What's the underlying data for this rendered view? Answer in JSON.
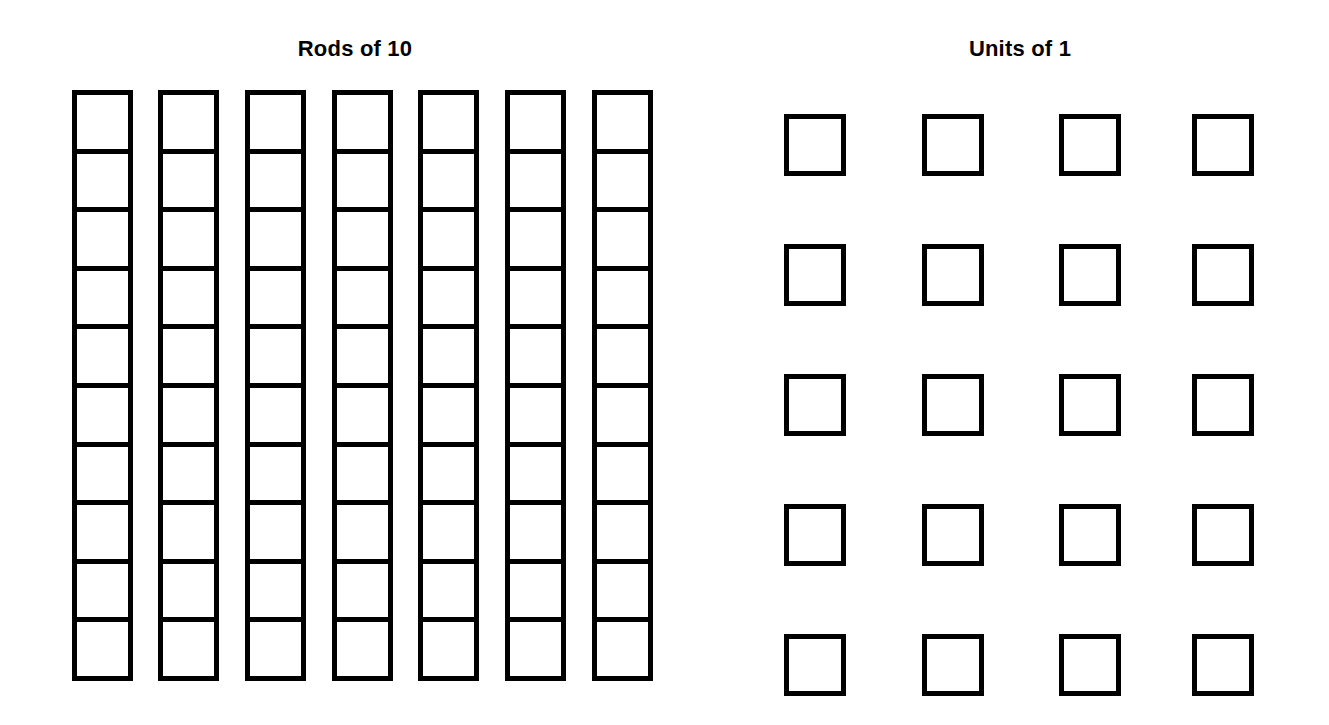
{
  "page": {
    "background_color": "#ffffff",
    "stroke_color": "#000000",
    "fill_color": "#ffffff",
    "width": 1329,
    "height": 725
  },
  "rods_section": {
    "title": "Rods of 10",
    "title_center_x": 355,
    "title_top": 38,
    "rod_count": 7,
    "cells_per_rod": 10,
    "total_value": 70,
    "rod_width": 61,
    "rod_top": 90,
    "rod_bottom": 681,
    "rod_x_positions": [
      72,
      158,
      245,
      332,
      418,
      505,
      592
    ]
  },
  "units_section": {
    "title": "Units of 1",
    "title_center_x": 1020,
    "title_top": 38,
    "unit_count": 20,
    "rows": 5,
    "columns": 4,
    "total_value": 20,
    "unit_size": 62,
    "unit_x_positions": [
      784,
      922,
      1059,
      1192
    ],
    "unit_y_positions": [
      114,
      244,
      374,
      504,
      634
    ]
  },
  "chart_data": {
    "type": "bar",
    "categories": [
      "Rods of 10",
      "Units of 1"
    ],
    "values": [
      7,
      20
    ],
    "series": [
      {
        "name": "Rods of 10",
        "count": 7,
        "unit_value": 10,
        "total": 70
      },
      {
        "name": "Units of 1",
        "count": 20,
        "unit_value": 1,
        "total": 20
      }
    ],
    "represented_number": 90,
    "xlabel": "",
    "ylabel": "",
    "legend": false,
    "grid": false
  }
}
